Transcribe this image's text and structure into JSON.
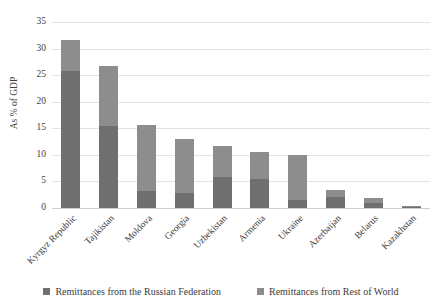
{
  "chart_data": {
    "type": "bar",
    "subtype": "stacked-bar",
    "title": "",
    "xlabel": "",
    "ylabel": "As % of GDP",
    "ylim": [
      0,
      35
    ],
    "ytick_step": 5,
    "yticks": [
      "35",
      "30",
      "25",
      "20",
      "15",
      "10",
      "5",
      "0"
    ],
    "grid": "horizontal",
    "legend_position": "bottom",
    "categories": [
      "Kyrgyz Republic",
      "Tajikistan",
      "Moldova",
      "Georgia",
      "Uzbekistan",
      "Armenia",
      "Ukraine",
      "Azerbaijan",
      "Belarus",
      "Kazakhstan"
    ],
    "series": [
      {
        "name": "Remittances from the Russian Federation",
        "color": "#6f6f6f",
        "values": [
          25.8,
          15.5,
          3.2,
          2.8,
          5.9,
          5.5,
          1.5,
          2.0,
          1.0,
          0.2
        ]
      },
      {
        "name": "Remittances from Rest of World",
        "color": "#8d8d8d",
        "values": [
          5.8,
          11.2,
          12.5,
          10.1,
          5.7,
          5.0,
          8.4,
          1.3,
          0.8,
          0.1
        ]
      }
    ],
    "totals": [
      31.6,
      26.7,
      15.7,
      12.9,
      11.6,
      10.5,
      9.9,
      3.3,
      1.8,
      0.3
    ]
  },
  "legend": {
    "items": [
      {
        "label": "Remittances from the Russian Federation",
        "color": "#6f6f6f"
      },
      {
        "label": "Remittances from Rest of World",
        "color": "#8d8d8d"
      }
    ]
  }
}
